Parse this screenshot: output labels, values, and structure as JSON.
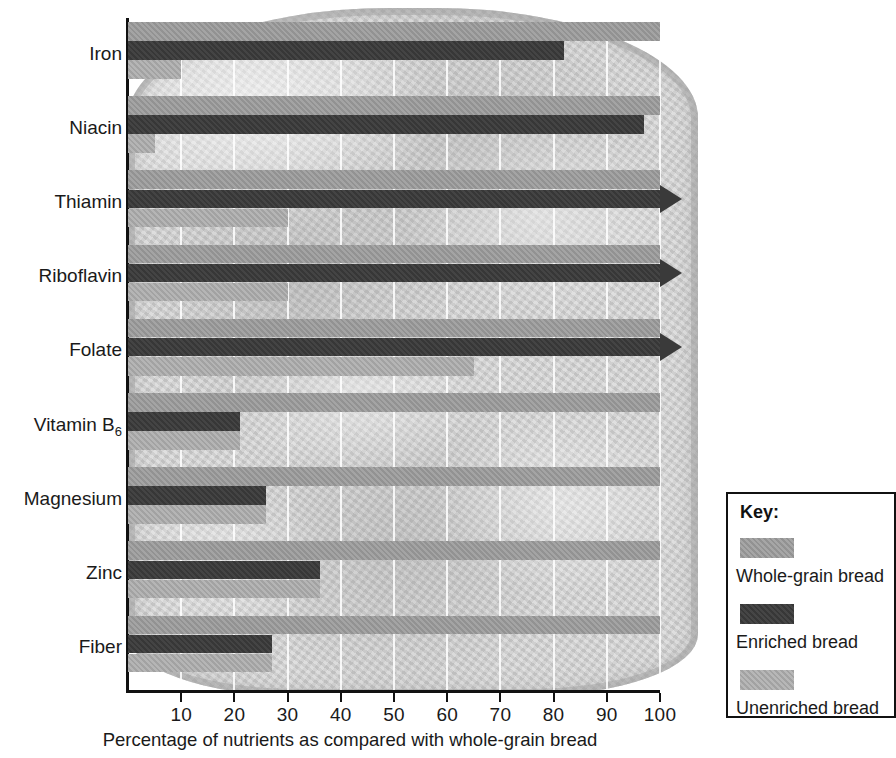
{
  "chart_data": {
    "type": "bar",
    "orientation": "horizontal",
    "title": "",
    "xlabel": "Percentage of nutrients as compared with whole-grain bread",
    "ylabel": "",
    "xlim": [
      0,
      100
    ],
    "xticks": [
      10,
      20,
      30,
      40,
      50,
      60,
      70,
      80,
      90,
      100
    ],
    "grid": true,
    "grid_axis": "x",
    "legend_position": "right",
    "categories": [
      "Iron",
      "Niacin",
      "Thiamin",
      "Riboflavin",
      "Folate",
      "Vitamin B6",
      "Magnesium",
      "Zinc",
      "Fiber"
    ],
    "series": [
      {
        "name": "Whole-grain bread",
        "color": "#9a9a9a",
        "values": [
          100,
          100,
          100,
          100,
          100,
          100,
          100,
          100,
          100
        ],
        "overflow": [
          false,
          false,
          false,
          false,
          false,
          false,
          false,
          false,
          false
        ]
      },
      {
        "name": "Enriched bread",
        "color": "#3a3a3a",
        "values": [
          82,
          97,
          107,
          107,
          107,
          21,
          26,
          36,
          27
        ],
        "overflow": [
          false,
          false,
          true,
          true,
          true,
          false,
          false,
          false,
          false
        ]
      },
      {
        "name": "Unenriched bread",
        "color": "#a9a9a9",
        "values": [
          10,
          5,
          30,
          30,
          65,
          21,
          26,
          36,
          27
        ],
        "overflow": [
          false,
          false,
          false,
          false,
          false,
          false,
          false,
          false,
          false
        ]
      }
    ]
  },
  "axis": {
    "tick_labels": [
      "10",
      "20",
      "30",
      "40",
      "50",
      "60",
      "70",
      "80",
      "90",
      "100"
    ],
    "title": "Percentage of nutrients as compared with whole-grain bread"
  },
  "categories": [
    {
      "label": "Iron",
      "sub": ""
    },
    {
      "label": "Niacin",
      "sub": ""
    },
    {
      "label": "Thiamin",
      "sub": ""
    },
    {
      "label": "Riboflavin",
      "sub": ""
    },
    {
      "label": "Folate",
      "sub": ""
    },
    {
      "label": "Vitamin B",
      "sub": "6"
    },
    {
      "label": "Magnesium",
      "sub": ""
    },
    {
      "label": "Zinc",
      "sub": ""
    },
    {
      "label": "Fiber",
      "sub": ""
    }
  ],
  "key": {
    "title": "Key:",
    "items": [
      {
        "label": "Whole-grain bread",
        "color": "#9a9a9a"
      },
      {
        "label": "Enriched bread",
        "color": "#3a3a3a"
      },
      {
        "label": "Unenriched bread",
        "color": "#a9a9a9"
      }
    ]
  },
  "colors": {
    "whole_grain": "#9a9a9a",
    "enriched": "#3a3a3a",
    "unenriched": "#a9a9a9",
    "axis": "#111111",
    "gridline": "#ffffff",
    "background": "#ffffff",
    "bread": "#cdcdcd"
  }
}
